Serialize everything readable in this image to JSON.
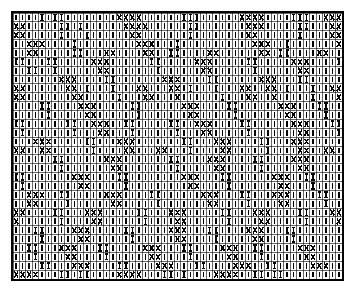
{
  "chart_data": {
    "type": "heatmap",
    "title": "",
    "xlabel": "",
    "ylabel": "",
    "grid": {
      "columns": 51,
      "rows": 30,
      "cell_width": 6.45,
      "cell_height": 8.93,
      "gridline_color": "#000000",
      "gridline_width": 0.6,
      "border_color": "#000000",
      "border_width": 2,
      "background": "#ffffff",
      "ink_color": "#000000"
    },
    "legend": [
      {
        "key": "bar",
        "symbol": "|",
        "label": "plain vertical bar stitch"
      },
      {
        "key": "cross",
        "symbol": "X",
        "label": "cross / X stitch"
      },
      {
        "key": "ibar",
        "symbol": "I",
        "label": "barred stitch (bar with ticks)"
      }
    ],
    "symbol_counts": {
      "bar": 1064,
      "cross": 210,
      "ibar": 256
    },
    "cells": [
      "bar,bar,bar,bar,ibar,bar,ibar,ibar,bar,bar,bar,bar,bar,bar,bar,bar,cross,cross,cross,cross,bar,bar,bar,bar,bar,bar,ibar,ibar,ibar,bar,bar,bar,bar,bar,bar,cross,cross,cross,cross,bar,bar,bar,bar,ibar,ibar,ibar,bar,bar,cross,cross,cross",
      "cross,cross,bar,bar,bar,bar,bar,ibar,ibar,bar,ibar,bar,bar,bar,bar,bar,bar,cross,cross,cross,cross,bar,bar,bar,bar,bar,bar,ibar,ibar,bar,bar,bar,bar,bar,bar,bar,cross,cross,cross,bar,bar,bar,bar,bar,ibar,ibar,bar,bar,bar,cross,cross",
      "cross,cross,bar,bar,bar,bar,bar,ibar,bar,bar,bar,ibar,bar,bar,bar,bar,bar,bar,cross,cross,bar,bar,bar,bar,bar,bar,bar,ibar,bar,bar,bar,bar,bar,bar,bar,bar,cross,cross,bar,bar,bar,bar,bar,bar,ibar,bar,bar,bar,bar,cross,cross",
      "bar,bar,cross,cross,cross,bar,bar,bar,bar,ibar,bar,bar,bar,bar,bar,bar,bar,bar,bar,cross,cross,cross,bar,bar,bar,ibar,bar,bar,bar,bar,bar,bar,bar,bar,bar,bar,bar,cross,cross,cross,bar,bar,ibar,bar,bar,bar,bar,bar,bar,bar,cross",
      "bar,bar,cross,cross,bar,bar,bar,bar,bar,ibar,ibar,bar,bar,bar,cross,cross,bar,bar,bar,bar,cross,cross,bar,bar,ibar,ibar,bar,bar,bar,bar,cross,cross,bar,bar,bar,bar,bar,bar,cross,cross,bar,ibar,ibar,bar,bar,bar,bar,cross,cross,bar,bar",
      "ibar,ibar,bar,bar,bar,ibar,ibar,bar,bar,bar,bar,bar,cross,cross,cross,bar,bar,bar,bar,bar,bar,ibar,ibar,bar,bar,bar,bar,bar,cross,cross,cross,bar,bar,bar,bar,bar,ibar,ibar,bar,bar,bar,bar,bar,cross,cross,cross,bar,bar,bar,bar,ibar",
      "bar,bar,ibar,ibar,bar,bar,ibar,bar,bar,bar,bar,bar,bar,cross,cross,bar,bar,bar,bar,bar,bar,bar,ibar,bar,bar,bar,bar,bar,bar,cross,cross,bar,bar,bar,bar,bar,bar,ibar,bar,bar,bar,bar,bar,bar,cross,cross,bar,bar,bar,bar,bar",
      "bar,bar,bar,bar,bar,bar,bar,cross,cross,cross,bar,bar,bar,bar,ibar,ibar,bar,bar,bar,bar,bar,bar,bar,cross,cross,cross,bar,bar,bar,bar,ibar,ibar,bar,bar,bar,bar,bar,bar,cross,cross,cross,bar,bar,bar,ibar,ibar,bar,bar,bar,bar,bar",
      "cross,cross,bar,bar,bar,bar,bar,bar,cross,cross,bar,ibar,bar,bar,bar,ibar,bar,bar,bar,cross,cross,bar,bar,bar,cross,cross,bar,ibar,bar,bar,bar,ibar,bar,bar,bar,cross,cross,bar,bar,cross,cross,bar,ibar,bar,bar,bar,ibar,bar,bar,cross,cross",
      "cross,cross,bar,bar,bar,bar,bar,bar,bar,cross,cross,bar,bar,bar,bar,bar,ibar,bar,bar,bar,cross,cross,bar,bar,bar,cross,bar,bar,bar,bar,bar,bar,ibar,bar,bar,bar,cross,cross,bar,bar,cross,bar,bar,bar,bar,bar,ibar,bar,bar,bar,cross",
      "bar,bar,bar,bar,ibar,ibar,bar,bar,bar,bar,cross,cross,cross,bar,bar,bar,bar,bar,ibar,ibar,bar,bar,bar,bar,bar,bar,cross,cross,cross,bar,bar,bar,bar,ibar,ibar,bar,bar,bar,bar,bar,bar,cross,cross,cross,bar,bar,bar,ibar,ibar,bar,bar",
      "bar,bar,bar,bar,bar,ibar,bar,bar,bar,bar,bar,cross,cross,bar,bar,bar,bar,bar,bar,ibar,bar,bar,bar,bar,bar,bar,bar,cross,cross,bar,bar,bar,bar,bar,ibar,bar,bar,bar,bar,bar,bar,bar,cross,cross,bar,bar,bar,bar,ibar,bar,bar",
      "ibar,ibar,bar,bar,bar,bar,bar,bar,ibar,ibar,bar,bar,cross,cross,cross,bar,bar,ibar,ibar,bar,bar,bar,bar,bar,ibar,ibar,bar,bar,cross,cross,cross,bar,bar,bar,bar,ibar,ibar,bar,bar,bar,bar,bar,bar,cross,cross,cross,bar,bar,bar,ibar,ibar",
      "bar,ibar,bar,bar,bar,bar,bar,bar,bar,ibar,bar,bar,bar,cross,cross,bar,bar,bar,ibar,bar,bar,bar,bar,bar,bar,ibar,bar,bar,bar,cross,cross,bar,bar,bar,bar,bar,ibar,bar,bar,bar,bar,bar,bar,bar,cross,cross,bar,bar,bar,bar,ibar",
      "bar,bar,bar,cross,cross,cross,bar,bar,bar,bar,bar,ibar,ibar,bar,bar,bar,cross,cross,cross,bar,bar,bar,bar,bar,bar,bar,ibar,ibar,bar,bar,bar,cross,cross,cross,bar,bar,bar,bar,ibar,ibar,bar,bar,bar,cross,cross,cross,bar,bar,bar,bar,bar",
      "cross,cross,bar,bar,cross,cross,bar,bar,bar,bar,bar,bar,ibar,bar,bar,bar,bar,cross,cross,bar,bar,bar,cross,cross,bar,bar,bar,ibar,bar,bar,bar,bar,cross,cross,bar,bar,bar,bar,bar,ibar,bar,bar,bar,bar,cross,cross,bar,bar,cross,cross,bar",
      "bar,bar,bar,bar,bar,bar,ibar,ibar,bar,bar,bar,bar,bar,bar,cross,cross,cross,bar,bar,bar,bar,bar,bar,bar,ibar,ibar,bar,bar,bar,bar,cross,cross,cross,bar,bar,bar,bar,ibar,ibar,bar,bar,bar,bar,cross,cross,cross,bar,bar,bar,bar,bar",
      "bar,bar,bar,bar,bar,bar,bar,ibar,bar,bar,bar,bar,bar,bar,bar,cross,cross,bar,bar,bar,bar,bar,bar,bar,bar,ibar,bar,bar,bar,bar,bar,cross,cross,bar,bar,bar,bar,bar,ibar,bar,bar,bar,bar,bar,cross,cross,bar,bar,bar,bar,bar",
      "ibar,ibar,bar,bar,bar,bar,bar,bar,bar,cross,cross,cross,bar,bar,bar,bar,ibar,ibar,bar,bar,bar,bar,bar,bar,bar,bar,cross,cross,cross,bar,bar,bar,ibar,ibar,bar,bar,bar,bar,bar,bar,cross,cross,cross,bar,bar,ibar,ibar,bar,bar,bar,bar",
      "bar,ibar,bar,bar,bar,bar,bar,bar,bar,bar,cross,cross,bar,bar,bar,bar,bar,ibar,bar,bar,bar,bar,bar,bar,bar,bar,bar,cross,cross,bar,bar,bar,bar,ibar,bar,bar,bar,bar,bar,bar,bar,cross,cross,bar,bar,bar,ibar,bar,bar,bar,bar",
      "bar,bar,cross,cross,cross,bar,bar,ibar,ibar,bar,bar,bar,bar,bar,cross,cross,cross,bar,bar,bar,bar,ibar,ibar,bar,bar,bar,bar,bar,bar,cross,cross,cross,bar,bar,bar,ibar,ibar,bar,bar,bar,cross,cross,cross,bar,bar,bar,bar,ibar,ibar,bar,bar",
      "bar,bar,cross,cross,bar,bar,bar,bar,ibar,bar,bar,bar,bar,bar,bar,cross,cross,bar,bar,bar,bar,bar,ibar,bar,bar,bar,bar,bar,bar,bar,cross,cross,bar,bar,bar,bar,ibar,bar,bar,bar,bar,cross,cross,bar,bar,bar,bar,bar,ibar,bar,bar",
      "cross,cross,bar,bar,bar,bar,ibar,ibar,bar,bar,bar,cross,cross,cross,bar,bar,bar,bar,bar,ibar,ibar,bar,bar,bar,cross,cross,cross,bar,bar,bar,bar,bar,ibar,ibar,bar,bar,bar,cross,cross,cross,bar,bar,bar,bar,ibar,ibar,bar,bar,bar,cross,cross",
      "cross,bar,bar,bar,bar,bar,bar,ibar,bar,bar,bar,bar,cross,cross,bar,bar,bar,bar,bar,bar,ibar,bar,bar,bar,bar,cross,cross,bar,bar,bar,bar,bar,bar,ibar,bar,bar,bar,bar,cross,cross,bar,bar,bar,bar,bar,ibar,bar,bar,bar,bar,cross",
      "bar,bar,bar,ibar,ibar,bar,bar,bar,bar,cross,cross,cross,bar,bar,bar,bar,bar,ibar,ibar,bar,bar,bar,bar,bar,cross,cross,cross,bar,bar,bar,ibar,ibar,bar,bar,bar,bar,cross,cross,cross,bar,bar,bar,ibar,ibar,bar,bar,bar,bar,bar,bar,bar",
      "bar,bar,bar,bar,ibar,bar,bar,bar,bar,bar,cross,cross,bar,bar,bar,bar,bar,bar,ibar,bar,bar,bar,bar,bar,bar,cross,cross,bar,bar,bar,bar,ibar,bar,bar,bar,bar,bar,cross,cross,bar,bar,bar,bar,ibar,bar,bar,bar,bar,bar,bar,bar",
      "bar,bar,ibar,ibar,bar,bar,bar,cross,cross,cross,bar,bar,bar,ibar,ibar,bar,bar,bar,bar,bar,cross,cross,cross,bar,bar,bar,ibar,ibar,bar,bar,bar,bar,cross,cross,cross,bar,bar,ibar,ibar,bar,bar,bar,bar,bar,cross,cross,cross,bar,bar,bar,bar",
      "bar,bar,bar,ibar,bar,bar,bar,bar,cross,cross,bar,bar,bar,bar,ibar,bar,bar,bar,bar,bar,bar,cross,cross,bar,bar,bar,bar,ibar,bar,bar,bar,bar,bar,cross,cross,bar,bar,bar,ibar,bar,bar,bar,bar,bar,bar,cross,cross,bar,bar,bar,bar",
      "bar,bar,bar,bar,ibar,ibar,bar,bar,bar,cross,cross,cross,bar,bar,bar,bar,ibar,ibar,bar,bar,bar,bar,cross,cross,cross,bar,bar,bar,ibar,ibar,bar,bar,bar,bar,cross,cross,cross,bar,bar,ibar,ibar,bar,bar,bar,bar,bar,cross,cross,cross,bar,bar",
      "cross,cross,cross,cross,bar,bar,bar,ibar,ibar,bar,ibar,ibar,bar,bar,bar,bar,cross,cross,cross,cross,bar,bar,bar,ibar,ibar,bar,ibar,bar,bar,bar,bar,cross,cross,cross,cross,bar,bar,ibar,ibar,bar,ibar,ibar,bar,bar,bar,bar,bar,bar,bar,bar,bar"
    ]
  }
}
